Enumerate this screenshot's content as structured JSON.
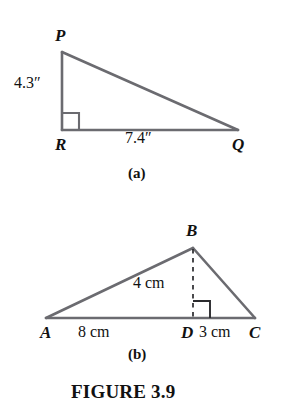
{
  "figure": {
    "caption": "FIGURE 3.9",
    "background_color": "#ffffff",
    "stroke_color": "#6b6b70",
    "text_color": "#111111"
  },
  "panels": [
    {
      "id": "a",
      "panel_label": "(a)",
      "shape": "right-triangle",
      "vertices": [
        {
          "name": "P",
          "label": "P",
          "x": 62,
          "y": 52
        },
        {
          "name": "R",
          "label": "R",
          "x": 62,
          "y": 130
        },
        {
          "name": "Q",
          "label": "Q",
          "x": 238,
          "y": 130
        }
      ],
      "right_angle_at": "R",
      "measures": [
        {
          "side": "PR",
          "label": "4.3″",
          "value": 4.3,
          "unit": "in"
        },
        {
          "side": "RQ",
          "label": "7.4″",
          "value": 7.4,
          "unit": "in"
        }
      ]
    },
    {
      "id": "b",
      "panel_label": "(b)",
      "shape": "triangle-with-altitude",
      "vertices": [
        {
          "name": "A",
          "label": "A",
          "x": 46,
          "y": 318
        },
        {
          "name": "B",
          "label": "B",
          "x": 193,
          "y": 248
        },
        {
          "name": "C",
          "label": "C",
          "x": 255,
          "y": 318
        },
        {
          "name": "D",
          "label": "D",
          "x": 193,
          "y": 318
        }
      ],
      "altitude": {
        "from": "B",
        "to": "D",
        "style": "dashed"
      },
      "right_angle_at": "D",
      "measures": [
        {
          "side": "BD",
          "label": "4 cm",
          "value": 4,
          "unit": "cm"
        },
        {
          "side": "AD",
          "label": "8 cm",
          "value": 8,
          "unit": "cm"
        },
        {
          "side": "DC",
          "label": "3 cm",
          "value": 3,
          "unit": "cm"
        }
      ]
    }
  ]
}
